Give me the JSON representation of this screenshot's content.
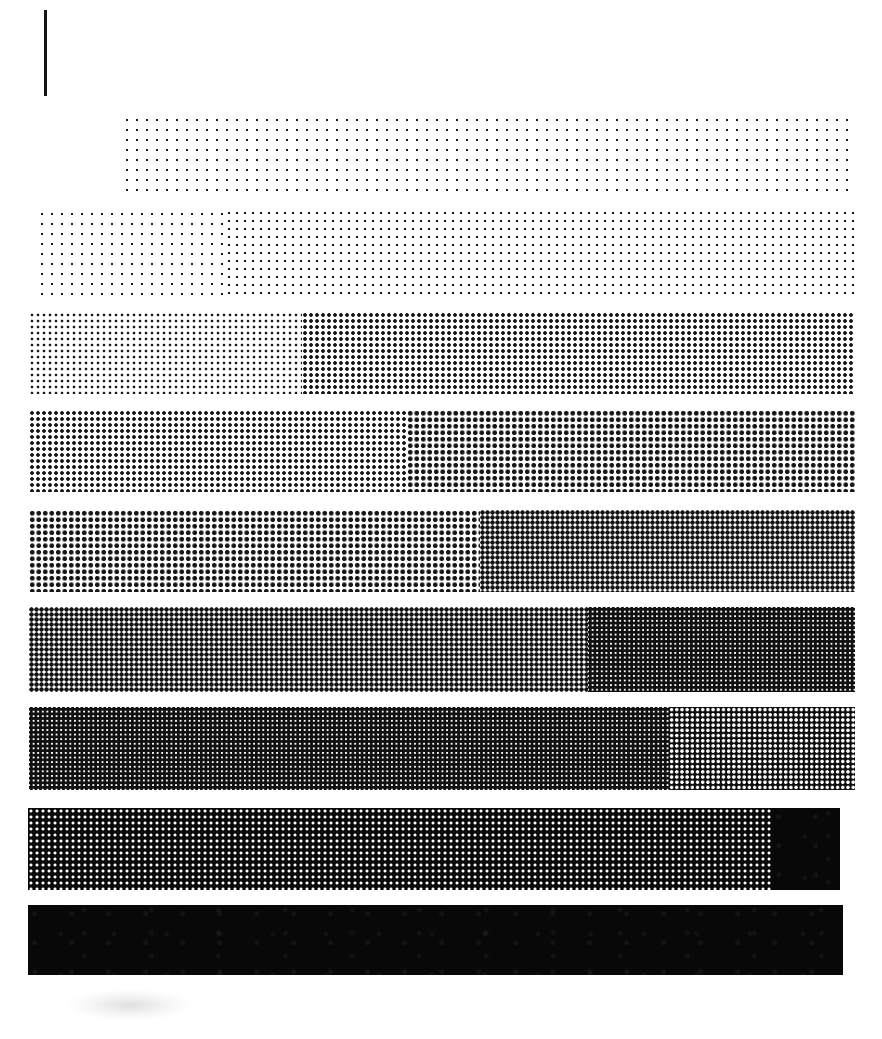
{
  "figure": {
    "width": 882,
    "height": 1039,
    "background_color": "#ffffff",
    "ink_color": "#0a0a0a",
    "tick_mark": {
      "name": "scale-tick",
      "x": 44,
      "y": 10,
      "width": 3,
      "height": 86,
      "color": "#141414"
    },
    "artifact": {
      "name": "scan-smudge",
      "x": 70,
      "y": 990,
      "width": 120,
      "height": 30
    }
  },
  "chart_data": {
    "type": "bar",
    "subtitle": "Nine stacked bars, each split into two successive halftone density steps",
    "xlabel": "",
    "ylabel": "",
    "xlim": [
      0,
      882
    ],
    "grid": false,
    "legend": "none",
    "orientation": "horizontal",
    "categories": [
      "Step 1",
      "Step 2",
      "Step 3",
      "Step 4",
      "Step 5",
      "Step 6",
      "Step 7",
      "Step 8",
      "Step 9"
    ],
    "values": [
      732,
      818,
      826,
      826,
      826,
      826,
      826,
      812,
      815
    ],
    "bars": [
      {
        "index": 1,
        "label": "Step 1",
        "x": 122,
        "y": 115,
        "width": 732,
        "height": 78,
        "segments": [
          {
            "name": "segment-a",
            "density_class": "d-1",
            "start": 0,
            "width": 732,
            "tone_percent": 8,
            "tone_label": "8%"
          }
        ]
      },
      {
        "index": 2,
        "label": "Step 2",
        "x": 37,
        "y": 209,
        "width": 818,
        "height": 88,
        "segments": [
          {
            "name": "segment-a",
            "density_class": "d-1",
            "start": 0,
            "width": 188,
            "tone_percent": 8,
            "tone_label": "8%"
          },
          {
            "name": "segment-b",
            "density_class": "d-2",
            "start": 188,
            "width": 630,
            "tone_percent": 14,
            "tone_label": "14%"
          }
        ]
      },
      {
        "index": 3,
        "label": "Step 3",
        "x": 29,
        "y": 312,
        "width": 826,
        "height": 82,
        "segments": [
          {
            "name": "segment-a",
            "density_class": "d-3",
            "start": 0,
            "width": 273,
            "tone_percent": 22,
            "tone_label": "22%"
          },
          {
            "name": "segment-b",
            "density_class": "d-4",
            "start": 273,
            "width": 553,
            "tone_percent": 34,
            "tone_label": "34%"
          }
        ]
      },
      {
        "index": 4,
        "label": "Step 4",
        "x": 29,
        "y": 410,
        "width": 826,
        "height": 82,
        "segments": [
          {
            "name": "segment-a",
            "density_class": "d-4",
            "start": 0,
            "width": 378,
            "tone_percent": 34,
            "tone_label": "34%"
          },
          {
            "name": "segment-b",
            "density_class": "d-5",
            "start": 378,
            "width": 448,
            "tone_percent": 45,
            "tone_label": "45%"
          }
        ]
      },
      {
        "index": 5,
        "label": "Step 5",
        "x": 29,
        "y": 510,
        "width": 826,
        "height": 82,
        "segments": [
          {
            "name": "segment-a",
            "density_class": "d-5",
            "start": 0,
            "width": 451,
            "tone_percent": 45,
            "tone_label": "45%"
          },
          {
            "name": "segment-b",
            "density_class": "d-6",
            "start": 451,
            "width": 375,
            "tone_percent": 56,
            "tone_label": "56%"
          }
        ]
      },
      {
        "index": 6,
        "label": "Step 6",
        "x": 29,
        "y": 607,
        "width": 826,
        "height": 85,
        "segments": [
          {
            "name": "segment-a",
            "density_class": "d-6",
            "start": 0,
            "width": 559,
            "tone_percent": 56,
            "tone_label": "56%"
          },
          {
            "name": "segment-b",
            "density_class": "d-7",
            "start": 559,
            "width": 267,
            "tone_percent": 66,
            "tone_label": "66%"
          }
        ]
      },
      {
        "index": 7,
        "label": "Step 7",
        "x": 29,
        "y": 707,
        "width": 826,
        "height": 83,
        "segments": [
          {
            "name": "segment-a",
            "density_class": "d-7",
            "start": 0,
            "width": 640,
            "tone_percent": 66,
            "tone_label": "66%"
          },
          {
            "name": "segment-b",
            "density_class": "d-9",
            "start": 640,
            "width": 186,
            "tone_percent": 78,
            "tone_label": "78%"
          }
        ]
      },
      {
        "index": 8,
        "label": "Step 8",
        "x": 28,
        "y": 808,
        "width": 812,
        "height": 82,
        "segments": [
          {
            "name": "segment-a",
            "density_class": "d-10",
            "start": 0,
            "width": 744,
            "tone_percent": 86,
            "tone_label": "86%"
          },
          {
            "name": "segment-b",
            "density_class": "d-13",
            "start": 744,
            "width": 68,
            "tone_percent": 100,
            "tone_label": "100%"
          }
        ]
      },
      {
        "index": 9,
        "label": "Step 9",
        "x": 28,
        "y": 905,
        "width": 815,
        "height": 70,
        "segments": [
          {
            "name": "segment-a",
            "density_class": "d-13",
            "start": 0,
            "width": 815,
            "tone_percent": 100,
            "tone_label": "100%"
          }
        ]
      }
    ]
  }
}
